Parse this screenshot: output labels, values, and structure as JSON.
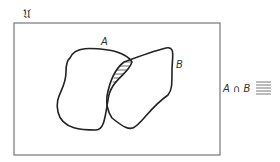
{
  "diagram": {
    "type": "venn",
    "universe_label": "𝔘",
    "sets": [
      {
        "name": "A",
        "label": "A"
      },
      {
        "name": "B",
        "label": "B"
      }
    ],
    "shaded_region": "intersection",
    "legend": {
      "label": "A ∩ B",
      "pattern": "horizontal-hatching"
    },
    "colors": {
      "stroke": "#222222",
      "frame": "#777777",
      "hatch": "#444444"
    }
  }
}
